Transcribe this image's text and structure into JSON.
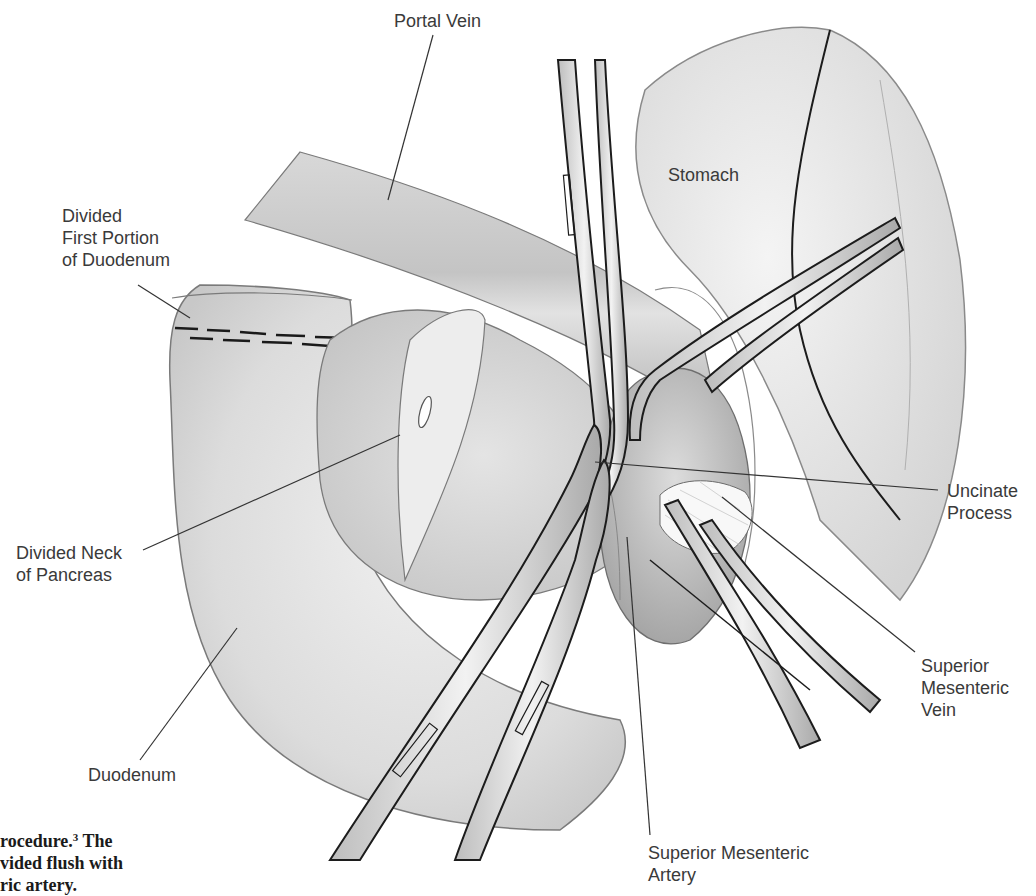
{
  "figure": {
    "labels": {
      "portal_vein": [
        "Portal Vein"
      ],
      "stomach": [
        "Stomach"
      ],
      "divided_first_portion": [
        "Divided",
        "First Portion",
        "of Duodenum"
      ],
      "divided_neck": [
        "Divided Neck",
        "of Pancreas"
      ],
      "duodenum": [
        "Duodenum"
      ],
      "uncinate_process": [
        "Uncinate",
        "Process"
      ],
      "smv": [
        "Superior",
        "Mesenteric",
        "Vein"
      ],
      "sma": [
        "Superior Mesenteric",
        "Artery"
      ]
    },
    "caption": {
      "line1_text": "rocedure.",
      "line1_ref": "3",
      "line1_tail": " The",
      "line2": "vided flush with",
      "line3": "ric artery."
    },
    "colors": {
      "tissue_light": "#e6e6e6",
      "tissue_mid": "#c9c9c9",
      "tissue_dark": "#a8a8a8",
      "outline": "#6e6e6e",
      "instrument_edge": "#1c1c1c",
      "leader": "#333333"
    }
  }
}
